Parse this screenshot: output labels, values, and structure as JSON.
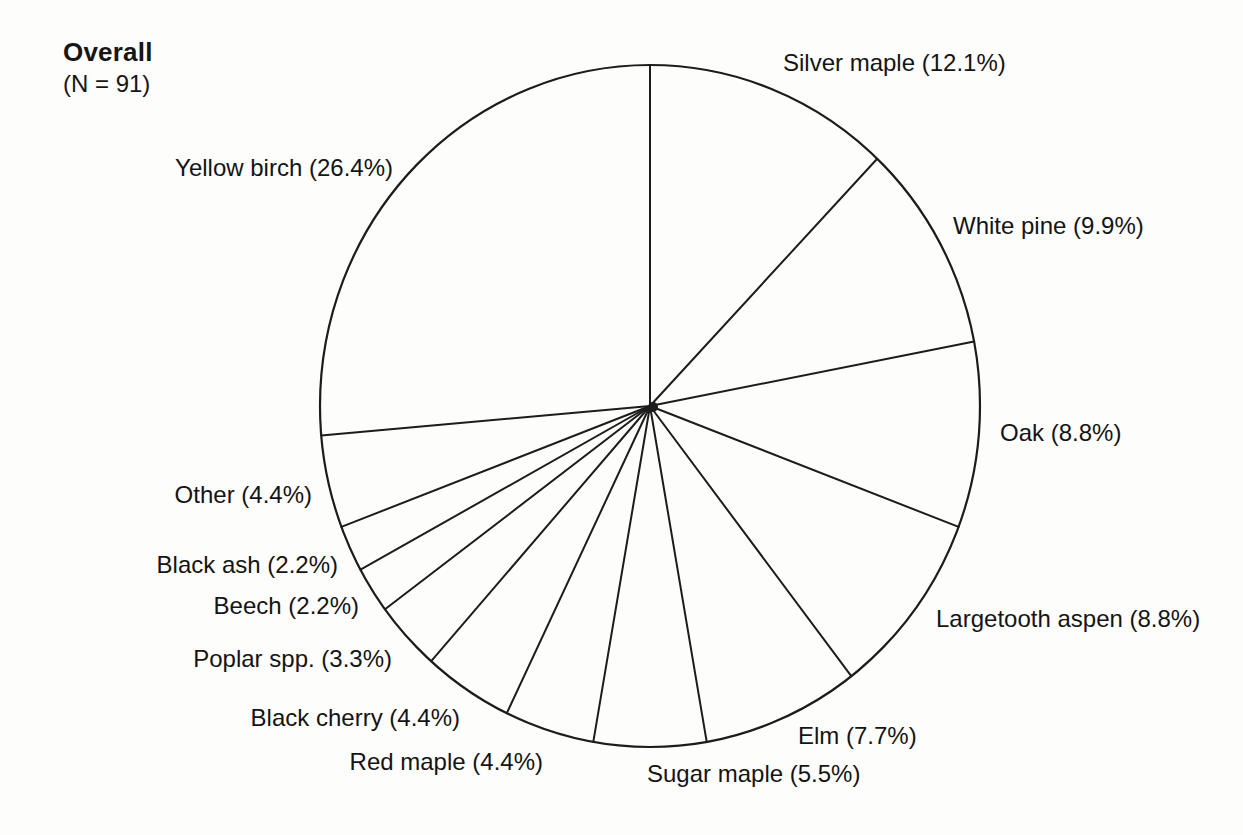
{
  "chart_data": {
    "type": "pie",
    "title": "Overall",
    "subtitle": "(N = 91)",
    "sample_size": 91,
    "unit": "%",
    "start_angle_deg": 0,
    "direction": "clockwise",
    "fill": "none",
    "stroke_color": "#1c1c1c",
    "background_color": "#fdfdfb",
    "slices": [
      {
        "name": "Silver maple",
        "value": 12.1,
        "label": "Silver maple (12.1%)"
      },
      {
        "name": "White pine",
        "value": 9.9,
        "label": "White pine (9.9%)"
      },
      {
        "name": "Oak",
        "value": 8.8,
        "label": "Oak (8.8%)"
      },
      {
        "name": "Largetooth aspen",
        "value": 8.8,
        "label": "Largetooth aspen (8.8%)"
      },
      {
        "name": "Elm",
        "value": 7.7,
        "label": "Elm (7.7%)"
      },
      {
        "name": "Sugar maple",
        "value": 5.5,
        "label": "Sugar maple (5.5%)"
      },
      {
        "name": "Red maple",
        "value": 4.4,
        "label": "Red maple (4.4%)"
      },
      {
        "name": "Black cherry",
        "value": 4.4,
        "label": "Black cherry (4.4%)"
      },
      {
        "name": "Poplar spp.",
        "value": 3.3,
        "label": "Poplar spp. (3.3%)"
      },
      {
        "name": "Beech",
        "value": 2.2,
        "label": "Beech (2.2%)"
      },
      {
        "name": "Black ash",
        "value": 2.2,
        "label": "Black ash (2.2%)"
      },
      {
        "name": "Other",
        "value": 4.4,
        "label": "Other (4.4%)"
      },
      {
        "name": "Yellow birch",
        "value": 26.4,
        "label": "Yellow birch (26.4%)"
      }
    ]
  }
}
